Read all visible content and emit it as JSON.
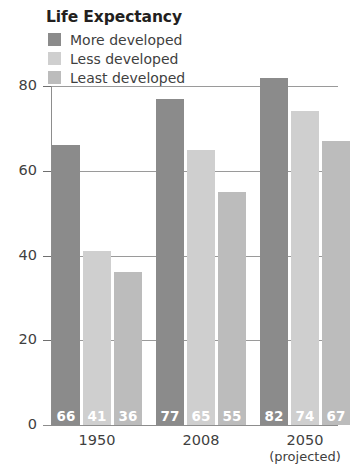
{
  "chart_data": {
    "type": "bar",
    "title": "Life Expectancy",
    "xlabel": "",
    "ylabel": "",
    "ylim": [
      0,
      80
    ],
    "yticks": [
      0,
      20,
      40,
      60,
      80
    ],
    "grid": "horizontal",
    "legend_position": "top-left",
    "categories": [
      "1950",
      "2008",
      "2050"
    ],
    "category_sublabels": [
      "",
      "",
      "(projected)"
    ],
    "series": [
      {
        "name": "More developed",
        "color": "#8b8b8b",
        "values": [
          66,
          41,
          82
        ]
      },
      {
        "name": "Less developed",
        "color": "#cfcfcf",
        "values": [
          41,
          65,
          74
        ]
      },
      {
        "name": "Least developed",
        "color": "#bcbcbc",
        "values": [
          36,
          55,
          67
        ]
      }
    ],
    "bars": [
      {
        "group": "1950",
        "series": "More developed",
        "value": 66,
        "label": "66",
        "color": "#8b8b8b"
      },
      {
        "group": "1950",
        "series": "Less developed",
        "value": 41,
        "label": "41",
        "color": "#cfcfcf"
      },
      {
        "group": "1950",
        "series": "Least developed",
        "value": 36,
        "label": "36",
        "color": "#bcbcbc"
      },
      {
        "group": "2008",
        "series": "More developed",
        "value": 77,
        "label": "77",
        "color": "#8b8b8b"
      },
      {
        "group": "2008",
        "series": "Less developed",
        "value": 65,
        "label": "65",
        "color": "#cfcfcf"
      },
      {
        "group": "2008",
        "series": "Least developed",
        "value": 55,
        "label": "55",
        "color": "#bcbcbc"
      },
      {
        "group": "2050",
        "series": "More developed",
        "value": 82,
        "label": "82",
        "color": "#8b8b8b"
      },
      {
        "group": "2050",
        "series": "Less developed",
        "value": 74,
        "label": "74",
        "color": "#cfcfcf"
      },
      {
        "group": "2050",
        "series": "Least developed",
        "value": 67,
        "label": "67",
        "color": "#bcbcbc"
      }
    ]
  },
  "title": "Life Expectancy",
  "legend": {
    "items": [
      {
        "label": "More developed",
        "color": "#8b8b8b"
      },
      {
        "label": "Less developed",
        "color": "#cfcfcf"
      },
      {
        "label": "Least developed",
        "color": "#bcbcbc"
      }
    ]
  },
  "axis": {
    "y_ticks": [
      "80",
      "60",
      "40",
      "20",
      "0"
    ],
    "x_groups": [
      {
        "label": "1950",
        "sub": ""
      },
      {
        "label": "2008",
        "sub": ""
      },
      {
        "label": "2050",
        "sub": "(projected)"
      }
    ]
  },
  "colors": {
    "more_developed": "#8b8b8b",
    "less_developed": "#cfcfcf",
    "least_developed": "#bcbcbc",
    "gridline": "#9a9a9a",
    "text": "#3f3f3f",
    "title": "#231f20",
    "value_label": "#ffffff"
  }
}
